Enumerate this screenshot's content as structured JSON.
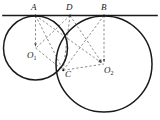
{
  "figure": {
    "background": "#ffffff",
    "stroke_solid": "#1a1a1a",
    "stroke_dashed": "#5a5a5a",
    "width": 160,
    "height": 120
  },
  "labels": {
    "A": "A",
    "D": "D",
    "B": "B",
    "C": "C",
    "O1_base": "O",
    "O1_sub": "1",
    "O2_base": "O",
    "O2_sub": "2"
  },
  "geometry": {
    "tangent_line": {
      "x1": 3,
      "y1": 15.5,
      "x2": 157,
      "y2": 15.5
    },
    "circle1": {
      "cx": 35.5,
      "cy": 48.0,
      "r": 32.0
    },
    "circle2": {
      "cx": 104.0,
      "cy": 64.0,
      "r": 48.0
    },
    "points": {
      "A": {
        "x": 35.5,
        "y": 15.5
      },
      "D": {
        "x": 70.0,
        "y": 15.5
      },
      "B": {
        "x": 104.0,
        "y": 15.5
      },
      "C": {
        "x": 63.2,
        "y": 70.3
      },
      "O1": {
        "x": 35.5,
        "y": 48.0
      },
      "O2": {
        "x": 104.0,
        "y": 64.0
      }
    },
    "dashed_segments": [
      "A-O1",
      "A-C",
      "A-O2",
      "A-B",
      "D-C",
      "D-O1",
      "D-O2",
      "B-C",
      "B-O2",
      "O1-C",
      "C-O2"
    ],
    "arrow_segments": [
      "A-O1",
      "A-O2",
      "B-O2",
      "D-O2"
    ]
  }
}
